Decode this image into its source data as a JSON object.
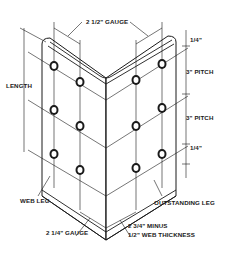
{
  "diagram": {
    "labels": {
      "gauge_top": "2 1/2\" GAUGE",
      "length": "LENGTH",
      "edge_top": "1/4\"",
      "pitch_1": "3\" PITCH",
      "pitch_2": "3\" PITCH",
      "edge_bottom": "1/4\"",
      "web_leg": "WEB LEG",
      "outstanding_leg": "OUTSTANDING LEG",
      "gauge_bottom": "2 1/4\" GAUGE",
      "minus_line1": "2 3/4\" MINUS",
      "minus_line2": "1/2\" WEB THICKNESS"
    },
    "bolts": {
      "web_leg_outer": 3,
      "web_leg_inner": 3,
      "outstanding_leg_inner": 3,
      "outstanding_leg_outer": 3
    },
    "colors": {
      "line": "#1a1a1a",
      "background": "#ffffff"
    }
  }
}
